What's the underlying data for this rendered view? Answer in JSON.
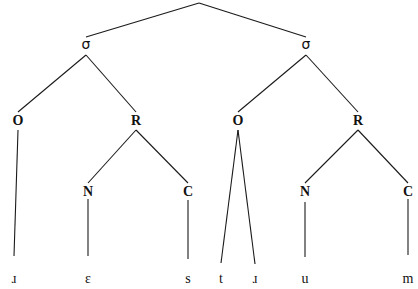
{
  "diagram": {
    "type": "syllable-tree",
    "nodes": [
      {
        "id": "root",
        "label": ""
      },
      {
        "id": "s1",
        "label": "σ",
        "parent": "root"
      },
      {
        "id": "s2",
        "label": "σ",
        "parent": "root"
      },
      {
        "id": "o1",
        "label": "O",
        "parent": "s1"
      },
      {
        "id": "r1",
        "label": "R",
        "parent": "s1"
      },
      {
        "id": "n1",
        "label": "N",
        "parent": "r1"
      },
      {
        "id": "c1",
        "label": "C",
        "parent": "r1"
      },
      {
        "id": "o2",
        "label": "O",
        "parent": "s2"
      },
      {
        "id": "r2",
        "label": "R",
        "parent": "s2"
      },
      {
        "id": "n2",
        "label": "N",
        "parent": "r2"
      },
      {
        "id": "c2",
        "label": "C",
        "parent": "r2"
      }
    ],
    "leaves": [
      {
        "id": "l1",
        "label": "ɹ",
        "parent": "o1"
      },
      {
        "id": "l2",
        "label": "ɛ",
        "parent": "n1"
      },
      {
        "id": "l3",
        "label": "s",
        "parent": "c1"
      },
      {
        "id": "l4",
        "label": "t",
        "parent": "o2"
      },
      {
        "id": "l5",
        "label": "ɹ",
        "parent": "o2"
      },
      {
        "id": "l6",
        "label": "u",
        "parent": "n2"
      },
      {
        "id": "l7",
        "label": "m",
        "parent": "c2"
      }
    ]
  }
}
